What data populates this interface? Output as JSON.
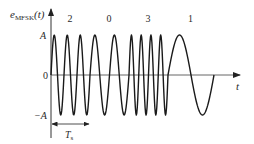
{
  "figure": {
    "ylabel_main": "e",
    "ylabel_sub": "MFSK",
    "ylabel_arg": "(t)",
    "xlabel": "t",
    "ytick_top": "A",
    "ytick_zero": "0",
    "ytick_bottom": "−A",
    "period_label_main": "T",
    "period_label_sub": "s",
    "colors": {
      "line": "#1a1a1a",
      "axis": "#333333",
      "zero_line": "#555555"
    }
  },
  "chart_data": {
    "type": "line",
    "title": "",
    "xlabel": "t",
    "ylabel": "e_MFSK(t)",
    "yticks": [
      "A",
      "0",
      "−A"
    ],
    "ylim": [
      -1,
      1
    ],
    "symbol_duration_label": "Ts",
    "symbols": [
      {
        "label": "2",
        "cycles": 3
      },
      {
        "label": "0",
        "cycles": 2
      },
      {
        "label": "3",
        "cycles": 4
      },
      {
        "label": "1",
        "cycles": 1
      }
    ],
    "amplitude": 1
  }
}
